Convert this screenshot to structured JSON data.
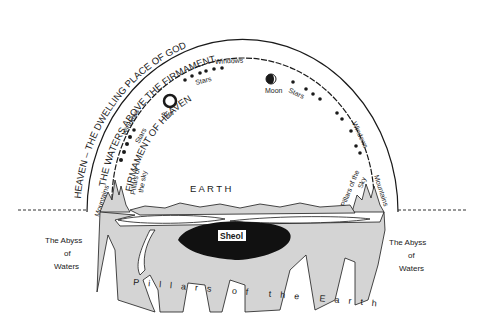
{
  "diagram": {
    "heaven_arc_label": "HEAVEN – THE DWELLING PLACE OF GOD",
    "waters_arc_label": "THE WATERS ABOVE THE FIRMAMENT",
    "firmament_arc_label": "FIRMAMENT OF HEAVEN",
    "earth_label": "E A R T H",
    "sheol_label": "Sheol",
    "pillars_earth_label": "Pillars of the Earth",
    "abyss_left": [
      "The Abyss",
      "of",
      "Waters"
    ],
    "abyss_right": [
      "The Abyss",
      "of",
      "Waters"
    ],
    "sun_label": "Sun",
    "moon_label": "Moon",
    "windows_top": "Windows",
    "windows_left": "Windows",
    "windows_right": "Windows",
    "stars_top_left": "Stars",
    "stars_left": "Stars",
    "stars_top_right": "Stars",
    "pillars_sky_left_1": "Pillars of",
    "pillars_sky_left_2": "the sky",
    "pillars_sky_right_1": "Pillars of the",
    "pillars_sky_right_2": "Sky",
    "mountains_left": "Mountains",
    "mountains_right": "Mountains",
    "colors": {
      "ink": "#1a1a1a",
      "ground": "#d4d4d4",
      "sheol": "#111111",
      "background": "#ffffff"
    }
  }
}
